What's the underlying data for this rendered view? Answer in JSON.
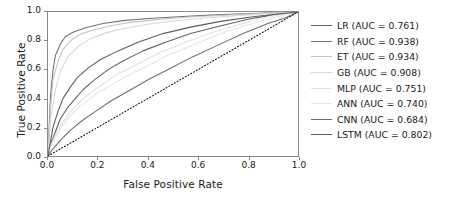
{
  "chart_data": {
    "type": "line",
    "title": "",
    "xlabel": "False Positive Rate",
    "ylabel": "True Positive Rate",
    "xlim": [
      0.0,
      1.0
    ],
    "ylim": [
      0.0,
      1.0
    ],
    "grid": false,
    "legend_position": "right-outside",
    "xticks": [
      "0.0",
      "0.2",
      "0.4",
      "0.6",
      "0.8",
      "1.0"
    ],
    "xtick_values": [
      0.0,
      0.2,
      0.4,
      0.6,
      0.8,
      1.0
    ],
    "yticks": [
      "0.0",
      "0.2",
      "0.4",
      "0.6",
      "0.8",
      "1.0"
    ],
    "ytick_values": [
      0.0,
      0.2,
      0.4,
      0.6,
      0.8,
      1.0
    ],
    "reference_line": {
      "name": "chance-diagonal",
      "style": "dotted",
      "color": "#111111",
      "x": [
        0.0,
        1.0
      ],
      "y": [
        0.0,
        1.0
      ]
    },
    "series": [
      {
        "name": "LR",
        "auc": 0.761,
        "label": "LR (AUC = 0.761)",
        "color": "#5f6368",
        "x": [
          0.0,
          0.01,
          0.03,
          0.05,
          0.08,
          0.11,
          0.14,
          0.18,
          0.24,
          0.3,
          0.38,
          0.47,
          0.57,
          0.68,
          0.8,
          0.9,
          1.0
        ],
        "y": [
          0.0,
          0.08,
          0.17,
          0.26,
          0.34,
          0.4,
          0.46,
          0.52,
          0.6,
          0.66,
          0.73,
          0.79,
          0.85,
          0.9,
          0.95,
          0.98,
          1.0
        ]
      },
      {
        "name": "RF",
        "auc": 0.938,
        "label": "RF (AUC = 0.938)",
        "color": "#707579",
        "x": [
          0.0,
          0.01,
          0.02,
          0.03,
          0.05,
          0.07,
          0.1,
          0.15,
          0.22,
          0.3,
          0.4,
          0.52,
          0.65,
          0.78,
          0.9,
          1.0
        ],
        "y": [
          0.0,
          0.42,
          0.6,
          0.7,
          0.78,
          0.83,
          0.86,
          0.89,
          0.92,
          0.94,
          0.955,
          0.967,
          0.978,
          0.987,
          0.995,
          1.0
        ]
      },
      {
        "name": "ET",
        "auc": 0.934,
        "label": "ET (AUC = 0.934)",
        "color": "#c3c6c9",
        "x": [
          0.0,
          0.01,
          0.02,
          0.04,
          0.06,
          0.09,
          0.13,
          0.18,
          0.25,
          0.33,
          0.43,
          0.55,
          0.68,
          0.8,
          0.9,
          1.0
        ],
        "y": [
          0.0,
          0.33,
          0.53,
          0.66,
          0.74,
          0.8,
          0.845,
          0.875,
          0.905,
          0.928,
          0.947,
          0.963,
          0.976,
          0.986,
          0.994,
          1.0
        ]
      },
      {
        "name": "GB",
        "auc": 0.908,
        "label": "GB (AUC = 0.908)",
        "color": "#d5d8da",
        "x": [
          0.0,
          0.01,
          0.03,
          0.05,
          0.08,
          0.12,
          0.17,
          0.23,
          0.31,
          0.4,
          0.5,
          0.62,
          0.74,
          0.85,
          0.93,
          1.0
        ],
        "y": [
          0.0,
          0.25,
          0.46,
          0.59,
          0.69,
          0.76,
          0.815,
          0.855,
          0.888,
          0.915,
          0.938,
          0.957,
          0.973,
          0.985,
          0.993,
          1.0
        ]
      },
      {
        "name": "MLP",
        "auc": 0.751,
        "label": "MLP (AUC = 0.751)",
        "color": "#dfe1e3",
        "x": [
          0.0,
          0.01,
          0.03,
          0.06,
          0.09,
          0.13,
          0.17,
          0.22,
          0.28,
          0.36,
          0.45,
          0.55,
          0.66,
          0.78,
          0.89,
          1.0
        ],
        "y": [
          0.0,
          0.07,
          0.15,
          0.24,
          0.31,
          0.38,
          0.44,
          0.5,
          0.57,
          0.64,
          0.72,
          0.79,
          0.86,
          0.92,
          0.97,
          1.0
        ]
      },
      {
        "name": "ANN",
        "auc": 0.74,
        "label": "ANN (AUC = 0.740)",
        "color": "#e3e5e7",
        "x": [
          0.0,
          0.01,
          0.03,
          0.06,
          0.1,
          0.14,
          0.19,
          0.24,
          0.31,
          0.39,
          0.48,
          0.58,
          0.69,
          0.8,
          0.9,
          1.0
        ],
        "y": [
          0.0,
          0.06,
          0.13,
          0.22,
          0.3,
          0.36,
          0.43,
          0.48,
          0.55,
          0.62,
          0.7,
          0.77,
          0.85,
          0.91,
          0.96,
          1.0
        ]
      },
      {
        "name": "CNN",
        "auc": 0.684,
        "label": "CNN (AUC = 0.684)",
        "color": "#6b7075",
        "x": [
          0.0,
          0.02,
          0.05,
          0.09,
          0.14,
          0.19,
          0.25,
          0.32,
          0.4,
          0.49,
          0.58,
          0.68,
          0.78,
          0.88,
          0.95,
          1.0
        ],
        "y": [
          0.0,
          0.05,
          0.11,
          0.18,
          0.25,
          0.31,
          0.38,
          0.45,
          0.53,
          0.61,
          0.69,
          0.77,
          0.85,
          0.92,
          0.96,
          1.0
        ]
      },
      {
        "name": "LSTM",
        "auc": 0.802,
        "label": "LSTM (AUC = 0.802)",
        "color": "#5a5f64",
        "x": [
          0.0,
          0.01,
          0.02,
          0.04,
          0.06,
          0.09,
          0.12,
          0.16,
          0.21,
          0.28,
          0.36,
          0.46,
          0.57,
          0.69,
          0.82,
          0.92,
          1.0
        ],
        "y": [
          0.0,
          0.1,
          0.2,
          0.31,
          0.4,
          0.48,
          0.55,
          0.61,
          0.67,
          0.73,
          0.79,
          0.85,
          0.895,
          0.935,
          0.967,
          0.986,
          1.0
        ]
      }
    ]
  }
}
